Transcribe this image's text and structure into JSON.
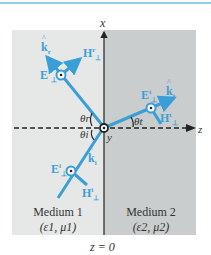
{
  "figure": {
    "axes": {
      "x_label": "x",
      "z_label": "z",
      "y_label": "y",
      "boundary_label": "z = 0"
    },
    "media": [
      {
        "name": "Medium 1",
        "params": "(ε1, μ1)",
        "fill": "#e6e8e8"
      },
      {
        "name": "Medium 2",
        "params": "(ε2, μ2)",
        "fill": "#c9cdcd"
      }
    ],
    "angles": {
      "reflected": "θr",
      "incident": "θi",
      "transmitted": "θt"
    },
    "waves": {
      "reflected": {
        "k": "k",
        "k_sub": "r",
        "E": "E",
        "E_sup": "r",
        "E_sub": "⊥",
        "H": "H",
        "H_sup": "r",
        "H_sub": "⊥"
      },
      "transmitted": {
        "k": "k",
        "k_sub": "t",
        "E": "E",
        "E_sup": "t",
        "E_sub": "⊥",
        "H": "H",
        "H_sup": "t",
        "H_sub": "⊥"
      },
      "incident": {
        "k": "k",
        "k_sub": "i",
        "E": "E",
        "E_sup": "i",
        "E_sub": "⊥",
        "H": "H",
        "H_sup": "i",
        "H_sub": "⊥"
      }
    },
    "colors": {
      "ray": "#3a9fd6",
      "axis": "#222222",
      "top_rule": "#8fd0e6"
    }
  }
}
